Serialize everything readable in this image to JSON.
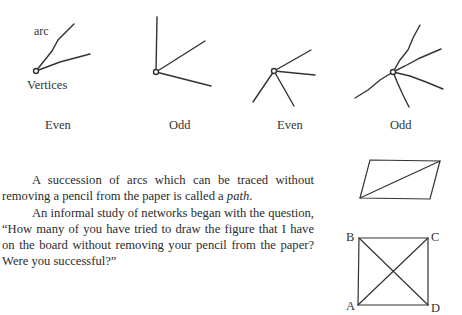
{
  "vertex_diagrams": {
    "arc_label": "arc",
    "vertices_label": "Vertices",
    "items": [
      {
        "label": "Even",
        "degree": 2
      },
      {
        "label": "Odd",
        "degree": 3
      },
      {
        "label": "Even",
        "degree": 4
      },
      {
        "label": "Odd",
        "degree": 5
      }
    ]
  },
  "text": {
    "para1_before": "A succession of arcs which can be traced without removing a pencil from the paper is called a ",
    "para1_term": "path",
    "para1_after": ".",
    "para2": "An informal study of networks began with the question, “How many of you have tried to draw the figure that I have on the board without removing your pencil from the paper? Were you successful?”"
  },
  "figures": {
    "parallelogram": {
      "has_diagonal": true
    },
    "square": {
      "vertices": {
        "top_left": "B",
        "top_right": "C",
        "bottom_left": "A",
        "bottom_right": "D"
      },
      "has_both_diagonals": true
    }
  }
}
